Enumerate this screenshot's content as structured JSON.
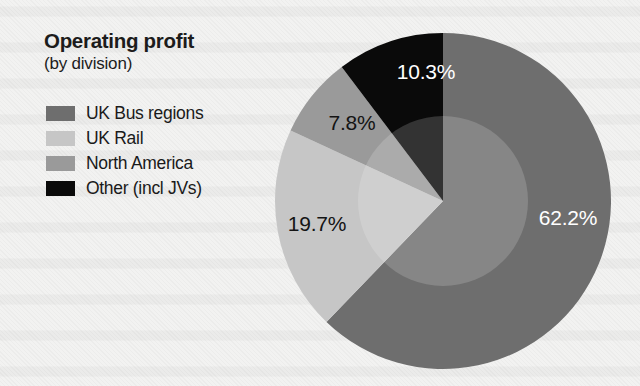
{
  "title": "Operating profit",
  "subtitle": "(by division)",
  "colors": {
    "uk_bus_regions": "#6e6e6e",
    "uk_rail": "#c6c6c6",
    "north_america": "#9a9a9a",
    "other": "#0a0a0a",
    "background": "#f2f2f1",
    "label_light": "#ffffff",
    "label_dark": "#141414"
  },
  "legend": {
    "items": [
      {
        "label": "UK Bus regions",
        "color": "#6e6e6e"
      },
      {
        "label": "UK Rail",
        "color": "#c6c6c6"
      },
      {
        "label": "North America",
        "color": "#9a9a9a"
      },
      {
        "label": "Other (incl JVs)",
        "color": "#0a0a0a"
      }
    ]
  },
  "pie_labels": {
    "uk_bus_regions": "62.2%",
    "uk_rail": "19.7%",
    "north_america": "7.8%",
    "other": "10.3%"
  },
  "chart_data": {
    "type": "pie",
    "title": "Operating profit",
    "subtitle": "(by division)",
    "xlabel": "",
    "ylabel": "",
    "unit": "percent",
    "start_angle_deg": 90,
    "direction": "clockwise",
    "legend_position": "left",
    "grid": false,
    "categories": [
      "UK Bus regions",
      "UK Rail",
      "North America",
      "Other (incl JVs)"
    ],
    "values": [
      62.2,
      19.7,
      7.8,
      10.3
    ],
    "slices": [
      {
        "label": "UK Bus regions",
        "value": 62.2,
        "display": "62.2%",
        "color": "#6e6e6e",
        "sweep_deg": 223.92,
        "label_text_color": "#ffffff"
      },
      {
        "label": "UK Rail",
        "value": 19.7,
        "display": "19.7%",
        "color": "#c6c6c6",
        "sweep_deg": 70.92,
        "label_text_color": "#141414"
      },
      {
        "label": "North America",
        "value": 7.8,
        "display": "7.8%",
        "color": "#9a9a9a",
        "sweep_deg": 28.08,
        "label_text_color": "#141414"
      },
      {
        "label": "Other (incl JVs)",
        "value": 10.3,
        "display": "10.3%",
        "color": "#0a0a0a",
        "sweep_deg": 37.08,
        "label_text_color": "#ffffff"
      }
    ],
    "total": 100.0
  }
}
